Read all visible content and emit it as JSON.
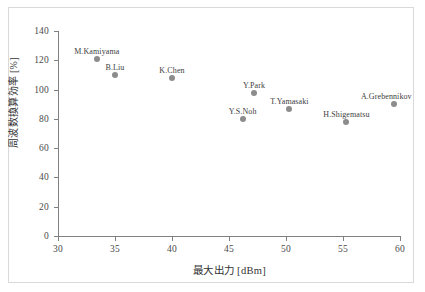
{
  "chart_data": {
    "type": "scatter",
    "title": "",
    "xlabel": "最大出力 [dBm]",
    "ylabel": "周波数換算効率 [%]",
    "xlim": [
      30,
      60
    ],
    "ylim": [
      0,
      140
    ],
    "xticks": [
      30,
      35,
      40,
      45,
      50,
      55,
      60
    ],
    "yticks": [
      0,
      20,
      40,
      60,
      80,
      100,
      120,
      140
    ],
    "grid": false,
    "legend": "none",
    "marker_color": "#8c8c8c",
    "axis_color": "#808080",
    "points": [
      {
        "label": "M.Kamiyama",
        "x": 33.4,
        "y": 121,
        "label_dx": 0,
        "label_dy": -12
      },
      {
        "label": "B.Liu",
        "x": 35.0,
        "y": 110,
        "label_dx": 0,
        "label_dy": -12
      },
      {
        "label": "K.Chen",
        "x": 40.0,
        "y": 108,
        "label_dx": 0,
        "label_dy": -12
      },
      {
        "label": "Y.S.Noh",
        "x": 46.2,
        "y": 80,
        "label_dx": 0,
        "label_dy": -12
      },
      {
        "label": "Y.Park",
        "x": 47.2,
        "y": 98,
        "label_dx": 0,
        "label_dy": -12
      },
      {
        "label": "T.Yamasaki",
        "x": 50.3,
        "y": 87,
        "label_dx": 0,
        "label_dy": -12
      },
      {
        "label": "H.Shigematsu",
        "x": 55.3,
        "y": 78,
        "label_dx": 0,
        "label_dy": -12
      },
      {
        "label": "A.Grebennikov",
        "x": 59.5,
        "y": 90,
        "label_dx": -8,
        "label_dy": -12
      }
    ]
  }
}
